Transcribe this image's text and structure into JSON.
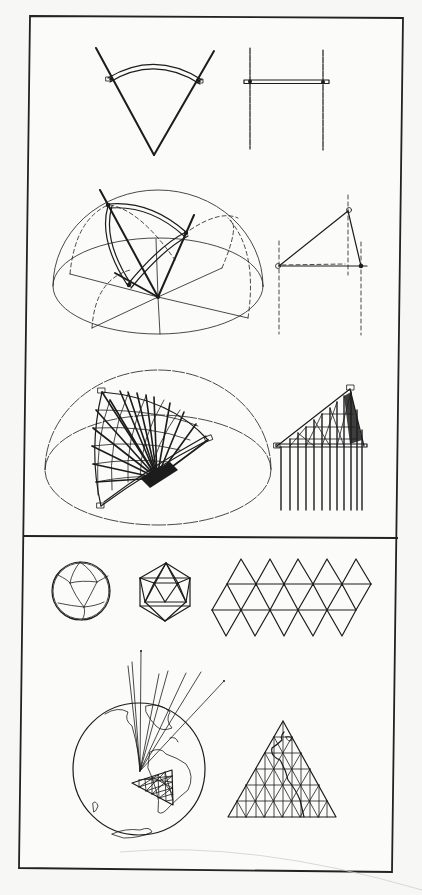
{
  "plate": {
    "title": "Geodesic construction and icosahedral map projection plate",
    "background": "#f7f7f5",
    "ink_color": "#1c1c1c",
    "frame": {
      "corners": [
        [
          30,
          16
        ],
        [
          403,
          18
        ],
        [
          392,
          872
        ],
        [
          19,
          868
        ]
      ],
      "divider_y": [
        536,
        538
      ]
    }
  },
  "panels": {
    "upper": {
      "name": "Great-circle strut construction",
      "rows": [
        {
          "left": {
            "figure": "v-sector-with-arc",
            "apex": [
              154,
              155
            ],
            "arms": [
              [
                96,
                48
              ],
              [
                214,
                51
              ]
            ],
            "arc": {
              "from": [
                110,
                79
              ],
              "to": [
                200,
                81
              ],
              "peak_y": 64
            }
          },
          "right": {
            "figure": "h-frame-elevation",
            "verticals_x": [
              250,
              323
            ],
            "y_range": [
              48,
              149
            ],
            "crossbar_y": 82
          }
        },
        {
          "left": {
            "figure": "hemisphere-with-spherical-triangle",
            "base_center": [
              158,
              286
            ],
            "rx": 105,
            "ry": 48,
            "top_y": 190,
            "hub": [
              158,
              297
            ]
          },
          "right": {
            "figure": "triangle-frame-elevation",
            "vertices": [
              [
                279,
                266
              ],
              [
                348,
                210
              ],
              [
                361,
                266
              ]
            ]
          }
        },
        {
          "left": {
            "figure": "hemisphere-with-dense-strut-fan",
            "base_center": [
              158,
              470
            ],
            "rx": 113,
            "ry": 55,
            "top_y": 370,
            "triangle": [
              [
                102,
                392
              ],
              [
                208,
                440
              ],
              [
                101,
                506
              ]
            ],
            "hub": [
              157,
              478
            ]
          },
          "right": {
            "figure": "triangle-frame-with-hanging-lines",
            "vertices": [
              [
                277,
                446
              ],
              [
                350,
                389
              ],
              [
                364,
                446
              ]
            ],
            "line_bottom_y": 510
          }
        }
      ]
    },
    "lower": {
      "name": "Icosahedron and map projection",
      "row1": [
        {
          "figure": "geodesic-sphere",
          "center": [
            81,
            591
          ],
          "r": 29
        },
        {
          "figure": "icosahedron",
          "top": [
            166,
            563
          ],
          "bottom": [
            165,
            621
          ],
          "x_range": [
            140,
            190
          ]
        },
        {
          "figure": "icosahedron-net",
          "top_apexes_x": [
            241,
            270,
            298,
            327,
            356
          ],
          "rows_y": [
            559,
            584,
            610,
            636
          ],
          "side": 29
        }
      ],
      "row2": [
        {
          "figure": "globe-with-projection-rays",
          "center": [
            139,
            769
          ],
          "r": 66,
          "ray_origin": [
            140,
            771
          ],
          "rays": 8
        },
        {
          "figure": "projected-triangle-grid",
          "apex": [
            283,
            721
          ],
          "base": [
            [
              228,
              817
            ],
            [
              336,
              817
            ]
          ],
          "divisions": 6
        }
      ]
    }
  }
}
